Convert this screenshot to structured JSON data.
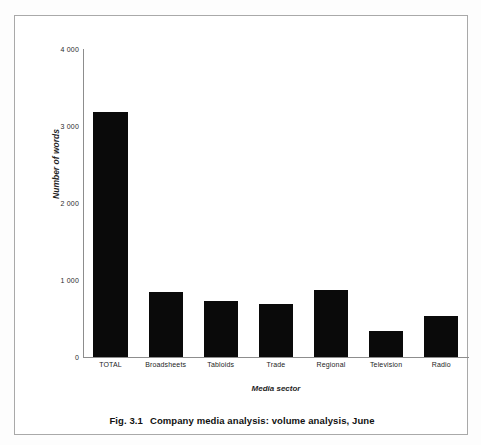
{
  "figure": {
    "caption_number": "Fig. 3.1",
    "caption_text": "Company media analysis: volume analysis, June"
  },
  "chart_data": {
    "type": "bar",
    "title": "Company media analysis: volume analysis, June",
    "categories": [
      "TOTAL",
      "Broadsheets",
      "Tabloids",
      "Trade",
      "Regional",
      "Television",
      "Radio"
    ],
    "values": [
      3180,
      840,
      730,
      690,
      870,
      340,
      530
    ],
    "xlabel": "Media sector",
    "ylabel": "Number of words",
    "ylim": [
      0,
      4000
    ],
    "ytick_values": [
      0,
      1000,
      2000,
      3000,
      4000
    ],
    "ytick_labels": [
      "0",
      "1 000",
      "2 000",
      "3 000",
      "4 000"
    ],
    "grid": false,
    "legend": false,
    "bar_color": "#0a0a0a",
    "axis_color": "#8d8d8d",
    "frame_color": "#a9a9a9",
    "background": "#ffffff"
  }
}
